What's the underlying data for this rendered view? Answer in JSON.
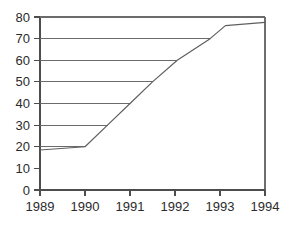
{
  "chart_data": {
    "type": "line",
    "title": "",
    "subtitle": "",
    "xlabel": "",
    "ylabel": "",
    "xlim": [
      1989,
      1994
    ],
    "ylim": [
      0,
      80
    ],
    "grid": false,
    "legend": null,
    "x_tick_labels": [
      "1989",
      "1990",
      "1991",
      "1992",
      "1993",
      "1994"
    ],
    "x_ticks": [
      1989,
      1990,
      1991,
      1992,
      1993,
      1994
    ],
    "y_tick_labels": [
      "0",
      "10",
      "20",
      "30",
      "40",
      "50",
      "60",
      "70",
      "80"
    ],
    "y_ticks": [
      0,
      10,
      20,
      30,
      40,
      50,
      60,
      70,
      80
    ],
    "series": [
      {
        "name": "series-1",
        "x": [
          1989,
          1990,
          1990.5,
          1991,
          1991.5,
          1992.05,
          1992.78,
          1993.12,
          1994
        ],
        "values": [
          18.5,
          20,
          30,
          40,
          50,
          60,
          70,
          76,
          77.5
        ]
      }
    ],
    "reference_lines": [
      {
        "y": 20,
        "x_start": 1989,
        "x_end": 1990
      },
      {
        "y": 30,
        "x_start": 1989,
        "x_end": 1990.5
      },
      {
        "y": 40,
        "x_start": 1989,
        "x_end": 1991
      },
      {
        "y": 50,
        "x_start": 1989,
        "x_end": 1991.5
      },
      {
        "y": 60,
        "x_start": 1989,
        "x_end": 1992.05
      },
      {
        "y": 70,
        "x_start": 1989,
        "x_end": 1992.78
      },
      {
        "y": 80,
        "x_start": 1989,
        "x_end": 1994
      }
    ],
    "colors": {
      "data_line": "#5f5f5f",
      "reference_line": "#6b6b6b",
      "axis": "#4d4d4d",
      "text": "#2b2b2b",
      "background": "#ffffff"
    }
  }
}
